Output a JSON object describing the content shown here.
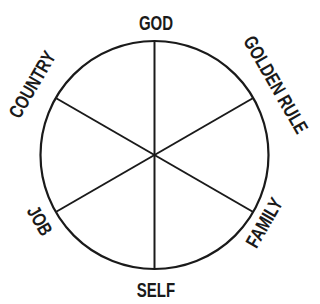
{
  "diagram": {
    "type": "wheel",
    "center": [
      154.5,
      155
    ],
    "radius": 114,
    "stroke_color": "#1a1a1a",
    "background": "#ffffff",
    "labels": {
      "top": "GOD",
      "top_right": "GOLDEN RULE",
      "bottom_right": "FAMILY",
      "bottom": "SELF",
      "bottom_left": "JOB",
      "top_left": "COUNTRY"
    }
  }
}
